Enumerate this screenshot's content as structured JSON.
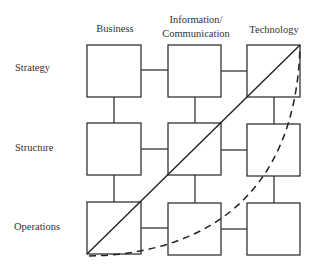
{
  "diagram": {
    "columns": [
      {
        "label": "Business",
        "x": 115
      },
      {
        "label_line1": "Information/",
        "label_line2": "Communication",
        "x": 195
      },
      {
        "label": "Technology",
        "x": 274
      }
    ],
    "rows": [
      {
        "label": "Strategy"
      },
      {
        "label": "Structure"
      },
      {
        "label": "Operations"
      }
    ],
    "grid": {
      "box_x": [
        87,
        168,
        247
      ],
      "box_y": [
        45,
        123,
        202
      ],
      "box_w": 54,
      "box_h": 52
    },
    "lines": {
      "solid_diagonal": {
        "from": "Operations/Business bottom-left",
        "to": "Strategy/Technology top-right",
        "style": "solid"
      },
      "dashed_curve": {
        "from": "Operations/Business bottom-left",
        "to": "Strategy/Technology top-right",
        "style": "dashed"
      }
    },
    "stroke_color": "#333333"
  }
}
